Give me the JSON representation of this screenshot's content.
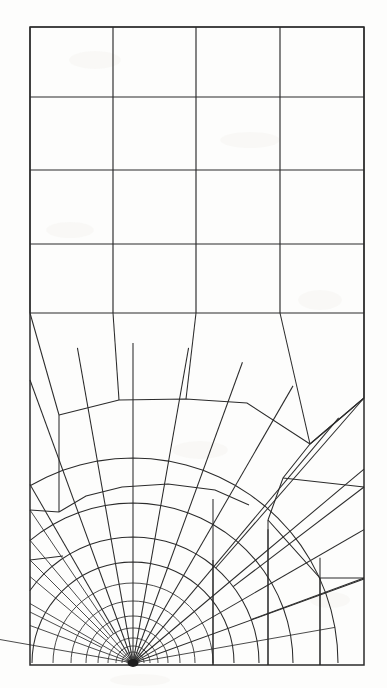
{
  "figure": {
    "type": "fe-mesh",
    "canvas": {
      "width": 387,
      "height": 688
    },
    "background_color": "#fdfdfc",
    "line_color": "#2b2b2b"
  },
  "domain": {
    "name": "rectangular-plate",
    "left": 30,
    "right": 364,
    "top": 27,
    "bottom": 665,
    "width_px": 334,
    "height_px": 638
  },
  "singularity": {
    "name": "crack-tip",
    "cx": 133,
    "cy": 663,
    "blob_radius": 5.5,
    "description": "focused node where all radial rays converge on the bottom edge"
  },
  "upper_grid": {
    "name": "structured-quad-grid",
    "rows": 4,
    "cols": 4,
    "horizontal_lines_y": [
      27,
      97,
      170,
      244,
      313
    ],
    "vertical_lines_x": [
      30,
      113,
      196,
      280,
      364
    ],
    "cell_count": 16
  },
  "transition_band": {
    "name": "transition-row",
    "top_y": 313,
    "description": "row of skewed quads joining the structured grid to the radial fan",
    "top_nodes_x": [
      30,
      113,
      196,
      280,
      364
    ],
    "lower_nodes": [
      {
        "x": 59,
        "y": 415
      },
      {
        "x": 119,
        "y": 400
      },
      {
        "x": 186,
        "y": 399
      },
      {
        "x": 247,
        "y": 403
      },
      {
        "x": 310,
        "y": 444
      },
      {
        "x": 364,
        "y": 398
      }
    ]
  },
  "radial_fan": {
    "name": "polar-refined-fan",
    "ray_count": 18,
    "ring_count": 12,
    "angular_span_deg": 180,
    "ring_radii_px": [
      6,
      11,
      17,
      25,
      35,
      47,
      62,
      80,
      101,
      126,
      160,
      205
    ],
    "ray_angles_deg": [
      0,
      10,
      20,
      30,
      40,
      50,
      60,
      70,
      80,
      90,
      100,
      110,
      120,
      130,
      140,
      150,
      160,
      170,
      180
    ],
    "description": "concentric arcs and radial rays graded geometrically toward the crack tip"
  },
  "outer_rays": {
    "name": "coarse-outer-rays",
    "right_edge_hits_y": [
      398,
      487,
      578
    ],
    "bottom_edge_hits_x": [
      213,
      268,
      320
    ],
    "left_edge_hits_y": [
      510,
      560,
      612
    ]
  },
  "legend": {
    "visible": false,
    "entries": []
  },
  "annotations": {
    "visible_text": [],
    "axis_labels": [],
    "tick_labels": []
  }
}
